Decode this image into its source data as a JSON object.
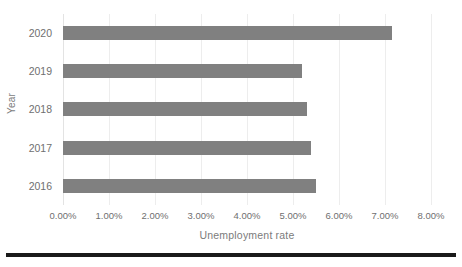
{
  "chart_data": {
    "type": "bar",
    "orientation": "horizontal",
    "title": "",
    "xlabel": "Unemployment rate",
    "ylabel": "Year",
    "categories": [
      "2020",
      "2019",
      "2018",
      "2017",
      "2016"
    ],
    "values": [
      7.15,
      5.2,
      5.3,
      5.4,
      5.5
    ],
    "value_labels": [
      "7.15%",
      "5.20%",
      "5.30%",
      "5.40%",
      "5.50%"
    ],
    "xlim": [
      0,
      8
    ],
    "xtick_values": [
      0,
      1,
      2,
      3,
      4,
      5,
      6,
      7,
      8
    ],
    "xtick_labels": [
      "0.00%",
      "1.00%",
      "2.00%",
      "3.00%",
      "4.00%",
      "5.00%",
      "6.00%",
      "7.00%",
      "8.00%"
    ],
    "grid": "vertical",
    "legend": "none",
    "series": [
      {
        "name": "Unemployment rate",
        "color": "#808080",
        "values": [
          7.15,
          5.2,
          5.3,
          5.4,
          5.5
        ]
      }
    ]
  },
  "colors": {
    "bar": "#808080",
    "gridline": "#ededed",
    "tick_text": "#6f6f6f",
    "axis_title": "#7b7b7b",
    "rule": "#1a1a1a"
  }
}
